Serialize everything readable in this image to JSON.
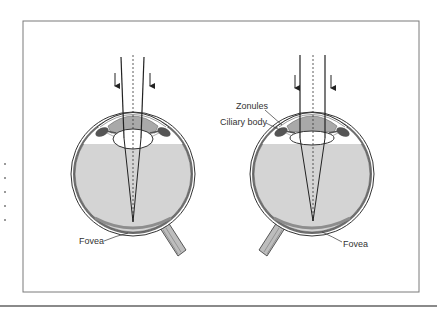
{
  "figure": {
    "panels": [
      {
        "id": "near",
        "lens_state": "thick",
        "labels": {
          "fovea": "Fovea"
        }
      },
      {
        "id": "distant",
        "lens_state": "thin",
        "labels": {
          "zonules": "Zonules",
          "ciliary_body": "Ciliary body",
          "fovea": "Fovea"
        }
      }
    ]
  },
  "colors": {
    "frame": "#7a7a7a",
    "vitreous": "#d4d4d4",
    "lens_anterior": "#a9a9a9",
    "sclera_dark": "#6e6e6e",
    "line": "#222222",
    "bottom_rule": "#8a8a8a"
  }
}
